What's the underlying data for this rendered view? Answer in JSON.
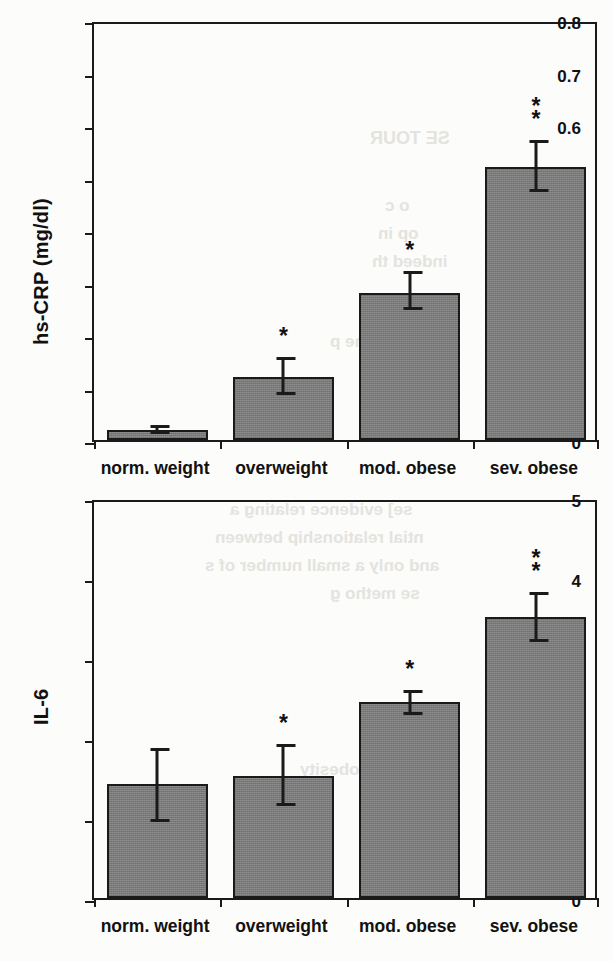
{
  "figure": {
    "background_color": "#fcfcfa",
    "bar_fill_color": "#808080",
    "line_color": "#1a1a1a"
  },
  "bleed_through_text": [
    "SE TOUR",
    "o c",
    "op  in",
    "indeed th",
    "ound  to  the p",
    "se] evidence relating a",
    "ntial relationship between",
    "and only a small number of s",
    "se metho  g",
    "and obesity"
  ],
  "chart_data": [
    {
      "id": "hs-crp",
      "type": "bar",
      "title": "",
      "xlabel": "",
      "ylabel": "hs-CRP (mg/dl)",
      "categories": [
        "norm. weight",
        "overweight",
        "mod. obese",
        "sev. obese"
      ],
      "values": [
        0.02,
        0.12,
        0.28,
        0.52
      ],
      "error_low": [
        0.012,
        0.085,
        0.247,
        0.473
      ],
      "error_high": [
        0.028,
        0.158,
        0.322,
        0.572
      ],
      "significance": [
        "",
        "*",
        "*",
        "**"
      ],
      "ylim": [
        0,
        0.8
      ],
      "yticks": [
        0,
        0.1,
        0.2,
        0.3,
        0.4,
        0.5,
        0.6,
        0.7,
        0.8
      ],
      "ytick_labels": [
        "0",
        "0.1",
        "0.2",
        "0.3",
        "0.4",
        "0.5",
        "0.6",
        "0.7",
        "0.8"
      ],
      "grid": false,
      "legend": "none"
    },
    {
      "id": "il-6",
      "type": "bar",
      "title": "",
      "xlabel": "",
      "ylabel": "IL-6",
      "categories": [
        "norm. weight",
        "overweight",
        "mod. obese",
        "sev. obese"
      ],
      "values": [
        1.42,
        1.53,
        2.45,
        3.51
      ],
      "error_low": [
        0.95,
        1.15,
        2.29,
        3.2
      ],
      "error_high": [
        1.88,
        1.93,
        2.6,
        3.82
      ],
      "significance": [
        "",
        "*",
        "*",
        "**"
      ],
      "ylim": [
        0,
        5
      ],
      "yticks": [
        0,
        1,
        2,
        3,
        4,
        5
      ],
      "ytick_labels": [
        "0",
        "1",
        "2",
        "3",
        "4",
        "5"
      ],
      "grid": false,
      "legend": "none"
    }
  ]
}
